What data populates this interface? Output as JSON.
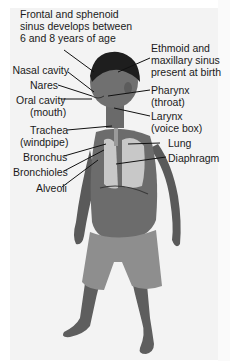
{
  "diagram": {
    "labels": {
      "frontal_sinus": [
        "Frontal and sphenoid",
        "sinus develops between",
        "6 and 8 years of age"
      ],
      "ethmoid_sinus": [
        "Ethmoid and",
        "maxillary sinus",
        "present at birth"
      ],
      "nasal_cavity": "Nasal cavity",
      "nares": "Nares",
      "oral_cavity": [
        "Oral cavity",
        "(mouth)"
      ],
      "pharynx": [
        "Pharynx",
        "(throat)"
      ],
      "larynx": [
        "Larynx",
        "(voice box)"
      ],
      "trachea": [
        "Trachea",
        "(windpipe)"
      ],
      "lung": "Lung",
      "bronchus": "Bronchus",
      "diaphragm": "Diaphragm",
      "bronchioles": "Bronchioles",
      "alveoli": "Alveoli"
    },
    "colors": {
      "panel_bg": "#f3f3f3",
      "text": "#1a1a1a",
      "leader_line": "#111111",
      "skin": "#6a6a6a",
      "hair": "#1e1e1e",
      "shorts": "#8e8e8e",
      "lung_highlight": "#d8d8d8"
    }
  }
}
